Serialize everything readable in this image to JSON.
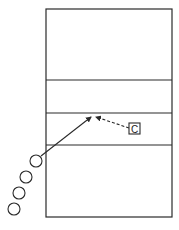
{
  "diagram": {
    "type": "volleyball-drill",
    "court": {
      "x": 46,
      "y": 9,
      "width": 126,
      "height": 208,
      "lines_y": [
        80,
        113,
        145
      ]
    },
    "players": [
      {
        "cx": 36,
        "cy": 161,
        "r": 6
      },
      {
        "cx": 26,
        "cy": 177,
        "r": 6
      },
      {
        "cx": 19,
        "cy": 193,
        "r": 6
      },
      {
        "cx": 14,
        "cy": 209,
        "r": 6
      }
    ],
    "coach": {
      "label": "C",
      "x": 129,
      "y": 123,
      "size": 11
    },
    "arrows": [
      {
        "style": "solid",
        "from": [
          41,
          156
        ],
        "to": [
          91,
          117
        ]
      },
      {
        "style": "dashed",
        "from": [
          129,
          128
        ],
        "to": [
          96,
          117
        ]
      }
    ],
    "colors": {
      "stroke": "#2a2a2a",
      "background": "#ffffff"
    }
  }
}
